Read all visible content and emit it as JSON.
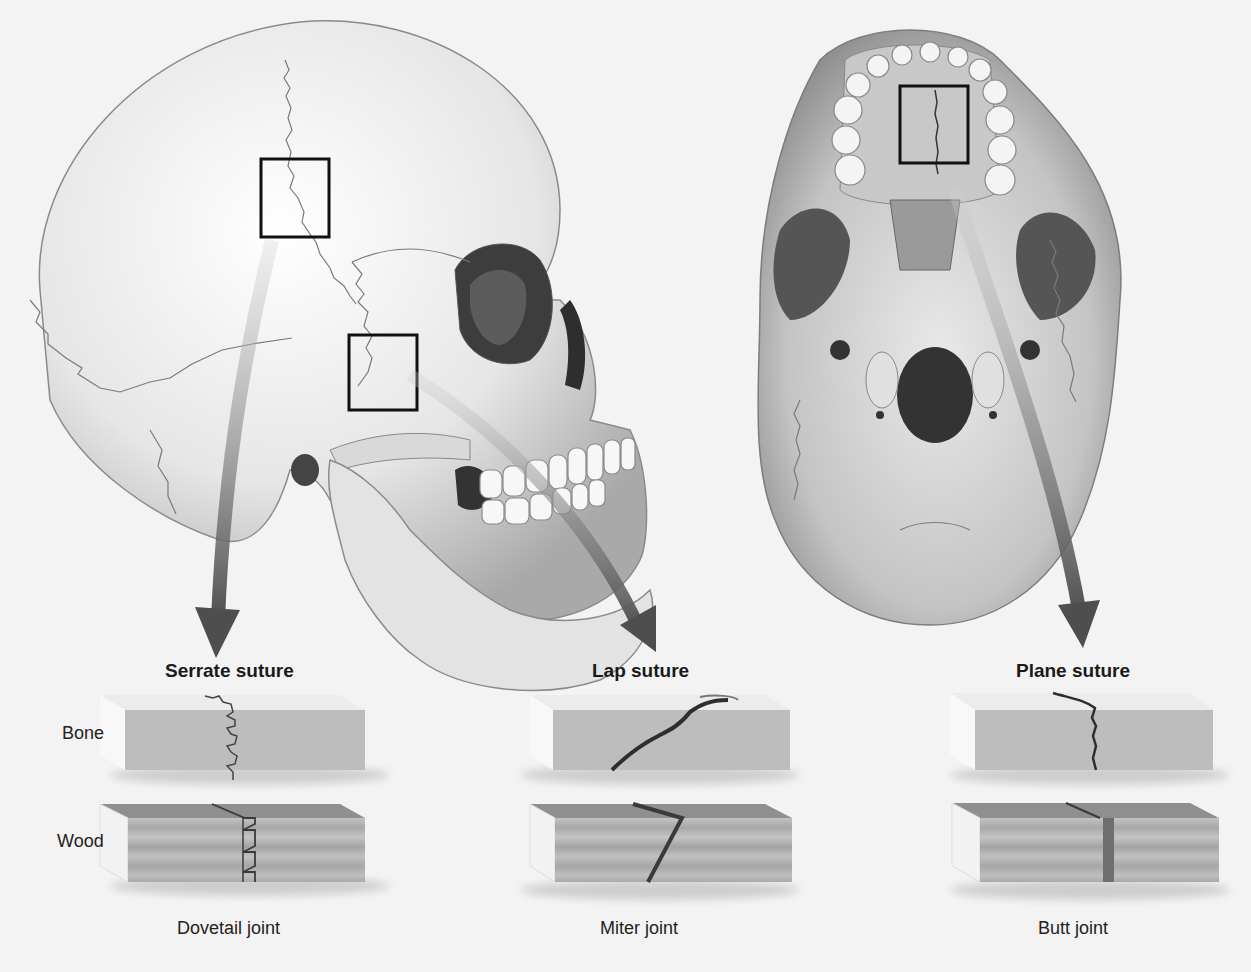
{
  "figure": {
    "colors": {
      "background": "#f3f3f3",
      "bone_block": "#bdbdbd",
      "bone_block_top": "#e9e9e9",
      "wood_block": "#b4b4b4",
      "wood_block_top": "#8f8f8f",
      "arrow": "#6a6a6a",
      "callout_box": "#111111"
    },
    "views": [
      {
        "name": "Lateral view of skull",
        "callouts": 2
      },
      {
        "name": "Inferior view of skull",
        "callouts": 1
      }
    ],
    "row_labels": {
      "bone": "Bone",
      "wood": "Wood"
    },
    "columns": [
      {
        "suture": "Serrate suture",
        "joint": "Dovetail joint"
      },
      {
        "suture": "Lap suture",
        "joint": "Miter joint"
      },
      {
        "suture": "Plane suture",
        "joint": "Butt joint"
      }
    ]
  }
}
